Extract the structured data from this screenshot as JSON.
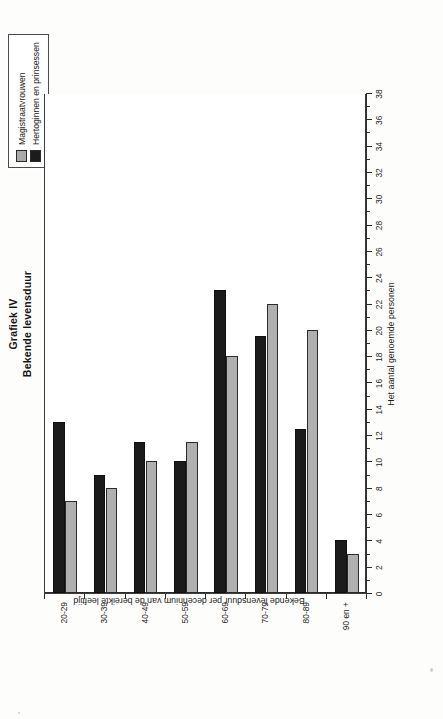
{
  "figure": {
    "title_line1": "Grafiek IV",
    "title_line2": "Bekende levensduur",
    "value_axis_title": "Het aantal genoemde personen",
    "category_axis_title": "Bekende levensduur per decennium van de bereikte leeftijd"
  },
  "legend": {
    "position": "top-right",
    "items": [
      {
        "label": "Magistraatvrouwen",
        "color": "#b0b0b0",
        "swatch": "gray-swatch"
      },
      {
        "label": "Hertoginnen en prinsessen",
        "color": "#1b1b1b",
        "swatch": "black-swatch"
      }
    ]
  },
  "chart_data": {
    "type": "bar",
    "orientation": "vertical",
    "xlabel": "Bekende levensduur per decennium van de bereikte leeftijd",
    "ylabel": "Het aantal genoemde personen",
    "ylim": [
      0,
      38
    ],
    "ytick_step_major": 2,
    "ytick_step_minor": 1,
    "grid": false,
    "legend_position": "top-right",
    "categories": [
      "20-29",
      "30-39",
      "40-49",
      "50-59",
      "60-69",
      "70-79",
      "80-89",
      "90 en +"
    ],
    "ytick_labels": [
      "0",
      "2",
      "4",
      "6",
      "8",
      "10",
      "12",
      "14",
      "16",
      "18",
      "20",
      "22",
      "24",
      "26",
      "28",
      "30",
      "32",
      "34",
      "36",
      "38"
    ],
    "series": [
      {
        "name": "Magistraatvrouwen",
        "color": "#b0b0b0",
        "values": [
          7,
          8,
          10,
          11.5,
          18,
          22,
          20,
          3
        ]
      },
      {
        "name": "Hertoginnen en prinsessen",
        "color": "#1b1b1b",
        "values": [
          13,
          9,
          11.5,
          10,
          23,
          19.5,
          12.5,
          4
        ]
      }
    ]
  }
}
